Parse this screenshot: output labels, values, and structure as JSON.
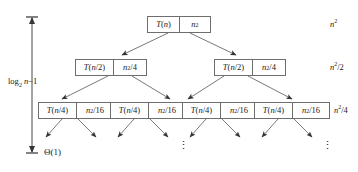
{
  "diagram": {
    "background_color": "#ffffff",
    "box_border_color": "#6e6e6e",
    "edge_color": "#555555",
    "text_color": "#1a1a1a"
  },
  "depth_axis": {
    "label_html": "log<sub>2</sub> <i>n</i>−1",
    "label_text": "log2 n-1",
    "arrow_style": "double-headed-vertical"
  },
  "leaf_label": {
    "text": "Θ(1)"
  },
  "levels": [
    {
      "index": 0,
      "row_cost_html": "<i>n</i><sup>2</sup>",
      "row_cost_text": "n^2",
      "nodes": [
        {
          "recurrence_html": "<i>T</i>(<i>n</i>)",
          "recurrence_text": "T(n)",
          "cost_html": "<i>n</i><sup>2</sup>",
          "cost_text": "n^2"
        }
      ]
    },
    {
      "index": 1,
      "row_cost_html": "<i>n</i><sup>2</sup>/2",
      "row_cost_text": "n^2/2",
      "nodes": [
        {
          "recurrence_html": "<i>T</i>(<i>n</i>/2)",
          "recurrence_text": "T(n/2)",
          "cost_html": "<i>n</i><sup>2</sup>/4",
          "cost_text": "n^2/4"
        },
        {
          "recurrence_html": "<i>T</i>(<i>n</i>/2)",
          "recurrence_text": "T(n/2)",
          "cost_html": "<i>n</i><sup>2</sup>/4",
          "cost_text": "n^2/4"
        }
      ]
    },
    {
      "index": 2,
      "row_cost_html": "<i>n</i><sup>2</sup>/4",
      "row_cost_text": "n^2/4",
      "nodes": [
        {
          "recurrence_html": "<i>T</i>(<i>n</i>/4)",
          "recurrence_text": "T(n/4)",
          "cost_html": "<i>n</i><sup>2</sup>/16",
          "cost_text": "n^2/16"
        },
        {
          "recurrence_html": "<i>T</i>(<i>n</i>/4)",
          "recurrence_text": "T(n/4)",
          "cost_html": "<i>n</i><sup>2</sup>/16",
          "cost_text": "n^2/16"
        },
        {
          "recurrence_html": "<i>T</i>(<i>n</i>/4)",
          "recurrence_text": "T(n/4)",
          "cost_html": "<i>n</i><sup>2</sup>/16",
          "cost_text": "n^2/16"
        },
        {
          "recurrence_html": "<i>T</i>(<i>n</i>/4)",
          "recurrence_text": "T(n/4)",
          "cost_html": "<i>n</i><sup>2</sup>/16",
          "cost_text": "n^2/16"
        }
      ]
    }
  ],
  "ellipses": [
    {
      "glyph": "⋮",
      "x": 178,
      "y": 146
    },
    {
      "glyph": "⋮",
      "x": 322,
      "y": 146
    }
  ]
}
